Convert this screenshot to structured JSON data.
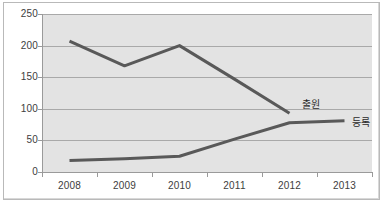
{
  "chart_data": {
    "type": "line",
    "title": "",
    "subtitle": "",
    "xlabel": "",
    "ylabel": "",
    "categories": [
      "2008",
      "2009",
      "2010",
      "2011",
      "2012",
      "2013"
    ],
    "ylim": [
      0,
      250
    ],
    "yticks": [
      0,
      50,
      100,
      150,
      200,
      250
    ],
    "ytick_labels": [
      "0",
      "50",
      "100",
      "150",
      "200",
      "250"
    ],
    "grid": true,
    "legend_position": "inline-right-of-series-end",
    "series": [
      {
        "name": "출원",
        "label": "출원",
        "color": "#595959",
        "values": [
          207,
          168,
          200,
          147,
          93,
          null
        ]
      },
      {
        "name": "등록",
        "label": "등록",
        "color": "#595959",
        "values": [
          18,
          21,
          25,
          52,
          78,
          81
        ]
      }
    ],
    "annotations": [
      {
        "text": "출원",
        "series": "출원",
        "x": 302,
        "y": 99
      },
      {
        "text": "등록",
        "series": "등록",
        "x": 352,
        "y": 117
      }
    ],
    "colors": {
      "plot_background": "#e3e3e3",
      "outer_background": "#ffffff",
      "gridline": "#a9a9a9",
      "axis": "#9a9a9a",
      "frame": "#b9b9b9",
      "tick_text": "#3d3d3d",
      "series_line": "#595959"
    }
  }
}
